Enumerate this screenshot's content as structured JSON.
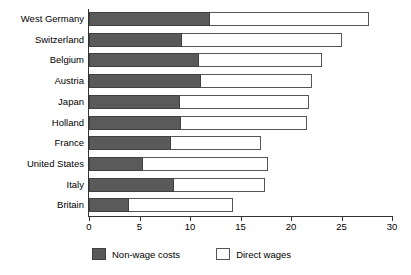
{
  "chart_data": {
    "type": "bar",
    "orientation": "horizontal",
    "stacked": true,
    "title": "",
    "xlabel": "",
    "ylabel": "",
    "xlim": [
      0,
      30
    ],
    "xticks": [
      0,
      5,
      10,
      15,
      20,
      25,
      30
    ],
    "xtick_labels": [
      "0",
      "5",
      "10",
      "15",
      "20",
      "25",
      "30"
    ],
    "grid": false,
    "legend_position": "bottom",
    "categories": [
      "West Germany",
      "Switzerland",
      "Belgium",
      "Austria",
      "Japan",
      "Holland",
      "France",
      "United States",
      "Italy",
      "Britain"
    ],
    "series": [
      {
        "name": "Non-wage costs",
        "color": "#5a5a5a",
        "values": [
          12.0,
          9.2,
          10.9,
          11.1,
          9.0,
          9.1,
          8.1,
          5.3,
          8.4,
          4.0
        ]
      },
      {
        "name": "Direct wages",
        "color": "#ffffff",
        "values": [
          15.7,
          15.9,
          12.2,
          11.0,
          12.8,
          12.5,
          8.9,
          12.4,
          9.0,
          10.3
        ]
      }
    ],
    "totals": [
      27.7,
      25.1,
      23.1,
      22.1,
      21.8,
      21.6,
      17.0,
      17.7,
      17.4,
      14.3
    ]
  },
  "legend": {
    "items": [
      {
        "label": "Non-wage costs",
        "swatch": "dark"
      },
      {
        "label": "Direct wages",
        "swatch": "light"
      }
    ]
  }
}
